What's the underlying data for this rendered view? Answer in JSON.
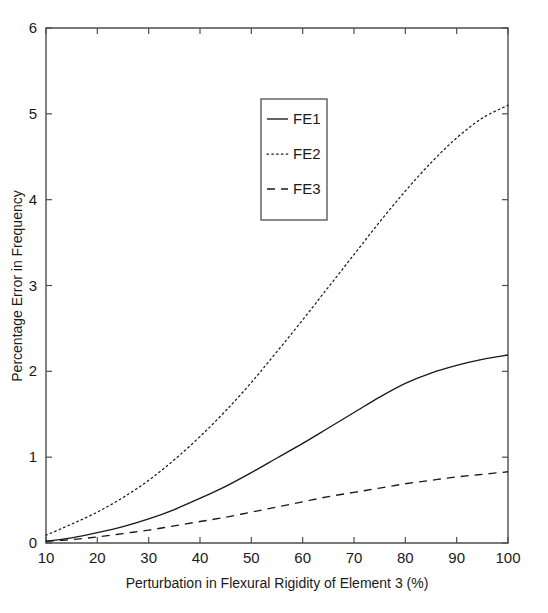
{
  "chart_data": {
    "type": "line",
    "title": "",
    "xlabel": "Perturbation in Flexural Rigidity of Element 3 (%)",
    "ylabel": "Percentage Error in Frequency",
    "xlim": [
      10,
      100
    ],
    "ylim": [
      0,
      6
    ],
    "xticks": [
      10,
      20,
      30,
      40,
      50,
      60,
      70,
      80,
      90,
      100
    ],
    "yticks": [
      0,
      1,
      2,
      3,
      4,
      5,
      6
    ],
    "xticklabels": [
      "10",
      "20",
      "30",
      "40",
      "50",
      "60",
      "70",
      "80",
      "90",
      "100"
    ],
    "yticklabels": [
      "0",
      "1",
      "2",
      "3",
      "4",
      "5",
      "6"
    ],
    "grid": false,
    "legend_position": "upper center",
    "x": [
      10,
      15,
      20,
      25,
      30,
      35,
      40,
      45,
      50,
      55,
      60,
      65,
      70,
      75,
      80,
      85,
      90,
      95,
      100
    ],
    "series": [
      {
        "name": "FE1",
        "style": "solid",
        "values": [
          0.02,
          0.06,
          0.12,
          0.19,
          0.28,
          0.39,
          0.52,
          0.66,
          0.82,
          0.99,
          1.16,
          1.34,
          1.52,
          1.7,
          1.86,
          1.98,
          2.07,
          2.14,
          2.19
        ]
      },
      {
        "name": "FE2",
        "style": "dotted",
        "values": [
          0.09,
          0.22,
          0.36,
          0.53,
          0.73,
          0.97,
          1.24,
          1.54,
          1.87,
          2.23,
          2.6,
          2.98,
          3.36,
          3.74,
          4.1,
          4.43,
          4.72,
          4.95,
          5.1
        ]
      },
      {
        "name": "FE3",
        "style": "dashed",
        "values": [
          0.02,
          0.04,
          0.07,
          0.11,
          0.15,
          0.2,
          0.25,
          0.3,
          0.36,
          0.42,
          0.48,
          0.54,
          0.59,
          0.64,
          0.69,
          0.73,
          0.77,
          0.8,
          0.83
        ]
      }
    ]
  },
  "legend": {
    "entries": [
      {
        "label": "FE1",
        "style": "solid"
      },
      {
        "label": "FE2",
        "style": "dotted"
      },
      {
        "label": "FE3",
        "style": "dashed"
      }
    ]
  },
  "colors": {
    "axis": "#4d4d4d",
    "line": "#1a1a1a",
    "background": "#ffffff"
  }
}
